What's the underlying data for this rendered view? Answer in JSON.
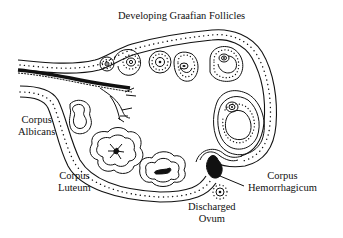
{
  "diagram": {
    "labels": {
      "developing_follicles": "Developing Graafian Follicles",
      "corpus_albicans_1": "Corpus",
      "corpus_albicans_2": "Albicans",
      "corpus_luteum_1": "Corpus",
      "corpus_luteum_2": "Luteum",
      "corpus_hemorrhagicum_1": "Corpus",
      "corpus_hemorrhagicum_2": "Hemorrhagicum",
      "discharged_ovum_1": "Discharged",
      "discharged_ovum_2": "Ovum"
    },
    "structures": [
      "Developing Graafian Follicles",
      "Corpus Albicans",
      "Corpus Luteum",
      "Corpus Hemorrhagicum",
      "Discharged Ovum",
      "Blood vessels (hilum)"
    ],
    "colors": {
      "ink": "#111111",
      "background": "#ffffff"
    }
  }
}
